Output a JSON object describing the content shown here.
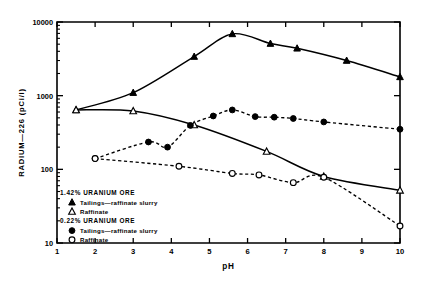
{
  "chart_data": {
    "type": "scatter",
    "title": "",
    "xlabel": "pH",
    "ylabel": "RADIUM—226 (pCi/l)",
    "xlim": [
      1,
      10
    ],
    "ylim": [
      10,
      10000
    ],
    "yscale": "log",
    "xscale": "linear",
    "grid": false,
    "legend_position": "lower-left-inside",
    "xticks": [
      1,
      2,
      3,
      4,
      5,
      6,
      7,
      8,
      9,
      10
    ],
    "xticklabels": [
      "1",
      "2",
      "3",
      "4",
      "5",
      "6",
      "7",
      "8",
      "9",
      "10"
    ],
    "yticks": [
      10,
      100,
      1000,
      10000
    ],
    "yticklabels": [
      "10",
      "100",
      "1000",
      "10000"
    ],
    "legend_groups": [
      {
        "heading": "1.42% URANIUM ORE",
        "entries": [
          {
            "marker": "filled-triangle",
            "label": "Tailings—raffinate  slurry"
          },
          {
            "marker": "open-triangle",
            "label": "Raffinate"
          }
        ]
      },
      {
        "heading": "0.22% URANIUM ORE",
        "entries": [
          {
            "marker": "filled-circle",
            "label": "Tailings—raffinate slurry"
          },
          {
            "marker": "open-circle",
            "label": "Raffinate"
          }
        ]
      }
    ],
    "series": [
      {
        "name": "1.42% URANIUM ORE — Tailings—raffinate slurry",
        "marker": "filled-triangle",
        "line": "solid",
        "points": [
          {
            "x": 1.5,
            "y": 640
          },
          {
            "x": 3.0,
            "y": 1100
          },
          {
            "x": 4.6,
            "y": 3400
          },
          {
            "x": 5.6,
            "y": 6900
          },
          {
            "x": 6.6,
            "y": 5100
          },
          {
            "x": 7.3,
            "y": 4400
          },
          {
            "x": 8.6,
            "y": 3000
          },
          {
            "x": 10.0,
            "y": 1800
          }
        ]
      },
      {
        "name": "1.42% URANIUM ORE — Raffinate",
        "marker": "open-triangle",
        "line": "solid",
        "points": [
          {
            "x": 1.5,
            "y": 640
          },
          {
            "x": 3.0,
            "y": 620
          },
          {
            "x": 4.6,
            "y": 400
          },
          {
            "x": 6.5,
            "y": 175
          },
          {
            "x": 8.0,
            "y": 80
          },
          {
            "x": 10.0,
            "y": 52
          }
        ]
      },
      {
        "name": "0.22% URANIUM ORE — Tailings—raffinate slurry",
        "marker": "filled-circle",
        "line": "dashed",
        "points": [
          {
            "x": 2.0,
            "y": 140
          },
          {
            "x": 3.4,
            "y": 235
          },
          {
            "x": 3.9,
            "y": 200
          },
          {
            "x": 4.5,
            "y": 395
          },
          {
            "x": 5.1,
            "y": 530
          },
          {
            "x": 5.6,
            "y": 640
          },
          {
            "x": 6.2,
            "y": 520
          },
          {
            "x": 6.7,
            "y": 510
          },
          {
            "x": 7.2,
            "y": 490
          },
          {
            "x": 8.0,
            "y": 440
          },
          {
            "x": 10.0,
            "y": 350
          }
        ]
      },
      {
        "name": "0.22% URANIUM ORE — Raffinate",
        "marker": "open-circle",
        "line": "dashed",
        "points": [
          {
            "x": 2.0,
            "y": 140
          },
          {
            "x": 4.2,
            "y": 110
          },
          {
            "x": 5.6,
            "y": 88
          },
          {
            "x": 6.3,
            "y": 84
          },
          {
            "x": 7.2,
            "y": 66
          },
          {
            "x": 8.0,
            "y": 78
          },
          {
            "x": 10.0,
            "y": 17
          }
        ]
      }
    ]
  }
}
